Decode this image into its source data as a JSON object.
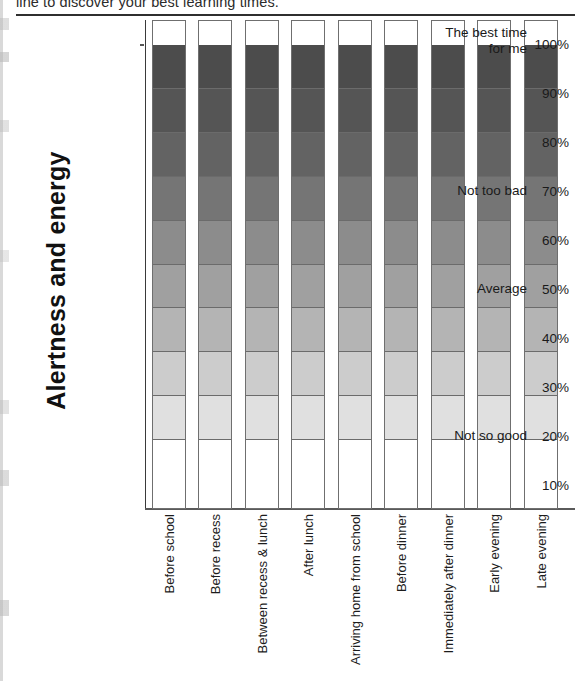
{
  "page": {
    "clipped_heading": "line to discover your best learning times."
  },
  "chart_data": {
    "type": "bar",
    "title": "",
    "ylabel": "Alertness and energy",
    "xlabel": "",
    "ylim": [
      5,
      105
    ],
    "grid": false,
    "legend": "none",
    "note": "Nine identical full-height stacked bars, each divided into ten 10% bands shaded from darkest at the top (100%) to white at the bottom (10%).",
    "categories": [
      "Before school",
      "Before recess",
      "Between recess & lunch",
      "After lunch",
      "Arriving home from school",
      "Before dinner",
      "Immediately after dinner",
      "Early evening",
      "Late evening"
    ],
    "values": [
      100,
      100,
      100,
      100,
      100,
      100,
      100,
      100,
      100
    ],
    "ytick_labels": [
      "100%",
      "90%",
      "80%",
      "70%",
      "60%",
      "50%",
      "40%",
      "30%",
      "20%",
      "10%"
    ],
    "ytick_values": [
      100,
      90,
      80,
      70,
      60,
      50,
      40,
      30,
      20,
      10
    ],
    "band_annotations": [
      {
        "text": "The best time for me",
        "at": 100
      },
      {
        "text": "Not too bad",
        "at": 70
      },
      {
        "text": "Average",
        "at": 50
      },
      {
        "text": "Not so good",
        "at": 20
      }
    ],
    "band_colors": [
      "#4c4c4c",
      "#555555",
      "#636363",
      "#757575",
      "#8c8c8c",
      "#a0a0a0",
      "#b4b4b4",
      "#cccccc",
      "#e0e0e0",
      "#ffffff"
    ]
  }
}
